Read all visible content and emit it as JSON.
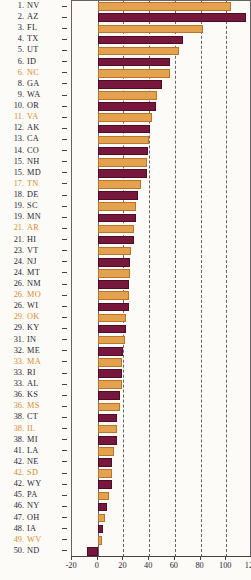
{
  "chart_data": {
    "type": "bar",
    "orientation": "horizontal",
    "title": "",
    "xlabel": "",
    "ylabel": "",
    "xlim": [
      -20,
      120
    ],
    "xticks": [
      -20,
      0,
      20,
      40,
      60,
      80,
      100,
      120
    ],
    "xticklabels": [
      "-20",
      "0",
      "20",
      "40",
      "60",
      "80",
      "100",
      "120"
    ],
    "grid": "vertical-dashed",
    "legend": "none",
    "colors": {
      "series_a": "#e4a14e",
      "series_b": "#78173c",
      "label_default": "#2b2535",
      "label_highlight": "#d98b33",
      "axis": "#4a4048",
      "background": "#fdfbf7"
    },
    "categories": [
      "NV",
      "AZ",
      "FL",
      "TX",
      "UT",
      "ID",
      "NC",
      "GA",
      "WA",
      "OR",
      "VA",
      "AK",
      "CA",
      "CO",
      "NH",
      "MD",
      "TN",
      "DE",
      "SC",
      "MN",
      "AR",
      "HI",
      "VT",
      "NJ",
      "MT",
      "NM",
      "MO",
      "WI",
      "OK",
      "KY",
      "IN",
      "ME",
      "MA",
      "RI",
      "AL",
      "KS",
      "MS",
      "CT",
      "IL",
      "MI",
      "LA",
      "NE",
      "SD",
      "WY",
      "PA",
      "NY",
      "OH",
      "IA",
      "WV",
      "ND"
    ],
    "ranks": [
      "1.",
      "2.",
      "3.",
      "4.",
      "5.",
      "6.",
      "6.",
      "8.",
      "9.",
      "10.",
      "11.",
      "12.",
      "13.",
      "14.",
      "15.",
      "15.",
      "17.",
      "18.",
      "19.",
      "19.",
      "21.",
      "21.",
      "23.",
      "24.",
      "24.",
      "26.",
      "26.",
      "26.",
      "29.",
      "29.",
      "31.",
      "32.",
      "33.",
      "33.",
      "33.",
      "36.",
      "36.",
      "38.",
      "38.",
      "38.",
      "41.",
      "42.",
      "42.",
      "42.",
      "45.",
      "46.",
      "47.",
      "48.",
      "49.",
      "50."
    ],
    "values": [
      104,
      115,
      82,
      66,
      63,
      56,
      56,
      50,
      46,
      45,
      42,
      41,
      40,
      39,
      38,
      38,
      34,
      31,
      30,
      30,
      28,
      28,
      26,
      25,
      25,
      24,
      24,
      24,
      22,
      22,
      21,
      20,
      19,
      19,
      19,
      17,
      17,
      15,
      15,
      15,
      13,
      11,
      11,
      11,
      9,
      7,
      6,
      4,
      3,
      -8
    ],
    "bar_colors": [
      "series_a",
      "series_b",
      "series_a",
      "series_b",
      "series_a",
      "series_b",
      "series_a",
      "series_b",
      "series_a",
      "series_b",
      "series_a",
      "series_b",
      "series_a",
      "series_b",
      "series_a",
      "series_b",
      "series_a",
      "series_b",
      "series_a",
      "series_b",
      "series_a",
      "series_b",
      "series_a",
      "series_b",
      "series_a",
      "series_b",
      "series_a",
      "series_b",
      "series_a",
      "series_b",
      "series_a",
      "series_b",
      "series_a",
      "series_b",
      "series_a",
      "series_b",
      "series_a",
      "series_b",
      "series_a",
      "series_b",
      "series_a",
      "series_b",
      "series_a",
      "series_b",
      "series_a",
      "series_b",
      "series_a",
      "series_b",
      "series_a",
      "series_b"
    ],
    "label_highlight": [
      false,
      false,
      false,
      false,
      false,
      false,
      true,
      false,
      false,
      false,
      true,
      false,
      false,
      false,
      false,
      false,
      true,
      false,
      false,
      false,
      true,
      false,
      false,
      false,
      false,
      false,
      true,
      false,
      true,
      false,
      false,
      false,
      true,
      false,
      false,
      false,
      true,
      false,
      true,
      false,
      false,
      false,
      true,
      false,
      false,
      false,
      false,
      false,
      true,
      false
    ]
  }
}
